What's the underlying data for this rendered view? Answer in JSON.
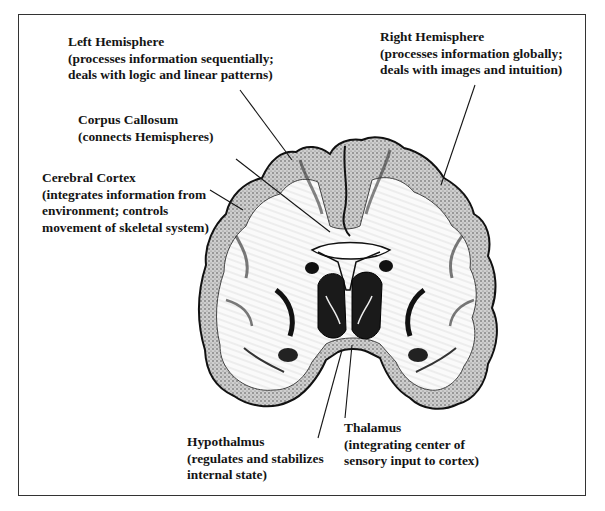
{
  "figure": {
    "frame": {
      "x": 18,
      "y": 14,
      "width": 568,
      "height": 482
    }
  },
  "labels": [
    {
      "id": "left-hemisphere",
      "title": "Left Hemisphere",
      "desc": [
        "(processes information sequentially;",
        "deals with logic and linear patterns)"
      ],
      "x": 68,
      "y": 34,
      "line": {
        "x1": 240,
        "y1": 90,
        "x2": 292,
        "y2": 160
      }
    },
    {
      "id": "right-hemisphere",
      "title": "Right Hemisphere",
      "desc": [
        "(processes information globally;",
        "deals with images and intuition)"
      ],
      "x": 380,
      "y": 29,
      "line": {
        "x1": 475,
        "y1": 85,
        "x2": 441,
        "y2": 185
      }
    },
    {
      "id": "corpus-callosum",
      "title": "Corpus Callosum",
      "desc": [
        "(connects Hemispheres)"
      ],
      "x": 78,
      "y": 112,
      "line": {
        "x1": 236,
        "y1": 159,
        "x2": 330,
        "y2": 232
      }
    },
    {
      "id": "cerebral-cortex",
      "title": "Cerebral Cortex",
      "desc": [
        "(integrates information from",
        "environment; controls",
        "movement of skeletal system)"
      ],
      "x": 42,
      "y": 170,
      "line": {
        "x1": 210,
        "y1": 190,
        "x2": 243,
        "y2": 210
      }
    },
    {
      "id": "hypothalmus",
      "title": "Hypothalmus",
      "desc": [
        "(regulates and stabilizes",
        "internal state)"
      ],
      "x": 187,
      "y": 434,
      "line": {
        "x1": 318,
        "y1": 438,
        "x2": 342,
        "y2": 350
      }
    },
    {
      "id": "thalamus",
      "title": "Thalamus",
      "desc": [
        "(integrating center of",
        "sensory input to cortex)"
      ],
      "x": 344,
      "y": 420,
      "line": {
        "x1": 345,
        "y1": 418,
        "x2": 352,
        "y2": 345
      }
    }
  ],
  "colors": {
    "ink": "#141414",
    "frame": "#333333",
    "background": "#ffffff",
    "shade": "#7a7a7a"
  }
}
